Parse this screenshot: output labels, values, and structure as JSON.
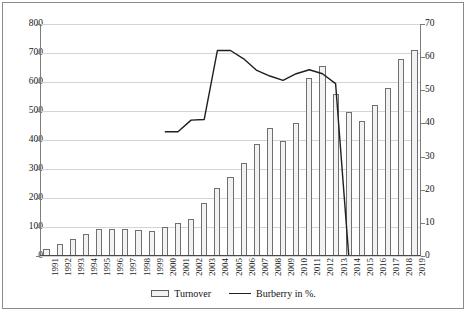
{
  "chart_data": {
    "type": "bar",
    "title": "",
    "subtitle": "",
    "xlabel": "",
    "ylabel": "",
    "grid": true,
    "legend_position": "bottom",
    "categories": [
      "1991",
      "1992",
      "1993",
      "1994",
      "1995",
      "1996",
      "1997",
      "1998",
      "1999",
      "2000",
      "2001",
      "2002",
      "2003",
      "2004",
      "2005",
      "2006",
      "2007",
      "2008",
      "2009",
      "2010",
      "2011",
      "2012",
      "2013",
      "2014",
      "2015",
      "2016",
      "2017",
      "2018",
      "2019"
    ],
    "axes": {
      "left": {
        "label": "",
        "min": 0,
        "max": 800,
        "step": 100,
        "ticks": [
          "0",
          "100",
          "200",
          "300",
          "400",
          "500",
          "600",
          "700",
          "800"
        ]
      },
      "right": {
        "label": "",
        "min": 0,
        "max": 70,
        "step": 10,
        "ticks": [
          "0",
          "10",
          "20",
          "30",
          "40",
          "50",
          "60",
          "70"
        ]
      }
    },
    "series": [
      {
        "name": "Turnover",
        "type": "bar",
        "axis": "left",
        "color": "#f2f2f2",
        "edge_color": "#6f6f6f",
        "values": [
          25,
          43,
          60,
          76,
          94,
          93,
          92,
          90,
          87,
          100,
          113,
          128,
          183,
          233,
          273,
          320,
          385,
          440,
          398,
          458,
          615,
          655,
          560,
          495,
          465,
          520,
          578,
          678,
          712
        ]
      },
      {
        "name": "Burberry in %.",
        "type": "line",
        "axis": "right",
        "color": "#1f1f1f",
        "x": [
          "2000",
          "2001",
          "2002",
          "2003",
          "2004",
          "2005",
          "2006",
          "2007",
          "2008",
          "2009",
          "2010",
          "2011",
          "2012",
          "2013",
          "2014"
        ],
        "values": [
          37.5,
          37.5,
          41.0,
          41.2,
          62.0,
          62.0,
          59.5,
          56.0,
          54.3,
          53.0,
          55.0,
          56.2,
          55.0,
          52.0,
          0.0
        ]
      }
    ]
  },
  "legend": {
    "items": [
      {
        "label": "Turnover",
        "marker": "bar-swatch"
      },
      {
        "label": "Burberry in %.",
        "marker": "line-swatch"
      }
    ]
  }
}
